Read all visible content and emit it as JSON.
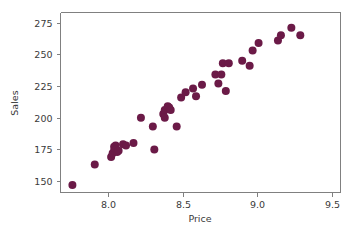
{
  "chart_data": {
    "type": "scatter",
    "title": "",
    "xlabel": "Price",
    "ylabel": "Sales",
    "xlim": [
      7.68,
      9.56
    ],
    "ylim": [
      141,
      283
    ],
    "xticks": [
      "8.0",
      "8.5",
      "9.0",
      "9.5"
    ],
    "xtick_values": [
      8.0,
      8.5,
      9.0,
      9.5
    ],
    "yticks": [
      "150",
      "175",
      "200",
      "225",
      "250",
      "275"
    ],
    "ytick_values": [
      150,
      175,
      200,
      225,
      250,
      275
    ],
    "grid": false,
    "legend": null,
    "marker_color": "#6b1a47",
    "marker_size": 4.0,
    "frame_color": "#808080",
    "background_color": "#ffffff",
    "x": [
      7.76,
      7.91,
      8.02,
      8.03,
      8.04,
      8.04,
      8.05,
      8.05,
      8.06,
      8.07,
      8.1,
      8.12,
      8.17,
      8.22,
      8.3,
      8.31,
      8.37,
      8.38,
      8.38,
      8.4,
      8.41,
      8.42,
      8.46,
      8.49,
      8.52,
      8.57,
      8.59,
      8.63,
      8.72,
      8.74,
      8.76,
      8.77,
      8.79,
      8.81,
      8.9,
      8.95,
      8.97,
      9.01,
      9.14,
      9.16,
      9.23,
      9.29
    ],
    "y": [
      147,
      163,
      169,
      172,
      174,
      177,
      178,
      175,
      173,
      174,
      179,
      178,
      180,
      200,
      193,
      175,
      203,
      206,
      200,
      209,
      208,
      206,
      193,
      216,
      220,
      223,
      217,
      226,
      234,
      227,
      234,
      243,
      221,
      243,
      245,
      241,
      253,
      259,
      261,
      265,
      271,
      265
    ],
    "points": [
      {
        "x": 7.76,
        "y": 147
      },
      {
        "x": 7.91,
        "y": 163
      },
      {
        "x": 8.02,
        "y": 169
      },
      {
        "x": 8.03,
        "y": 172
      },
      {
        "x": 8.04,
        "y": 174
      },
      {
        "x": 8.04,
        "y": 177
      },
      {
        "x": 8.05,
        "y": 178
      },
      {
        "x": 8.05,
        "y": 175
      },
      {
        "x": 8.06,
        "y": 173
      },
      {
        "x": 8.07,
        "y": 174
      },
      {
        "x": 8.1,
        "y": 179
      },
      {
        "x": 8.12,
        "y": 178
      },
      {
        "x": 8.17,
        "y": 180
      },
      {
        "x": 8.22,
        "y": 200
      },
      {
        "x": 8.3,
        "y": 193
      },
      {
        "x": 8.31,
        "y": 175
      },
      {
        "x": 8.37,
        "y": 203
      },
      {
        "x": 8.38,
        "y": 206
      },
      {
        "x": 8.38,
        "y": 200
      },
      {
        "x": 8.4,
        "y": 209
      },
      {
        "x": 8.41,
        "y": 208
      },
      {
        "x": 8.42,
        "y": 206
      },
      {
        "x": 8.46,
        "y": 193
      },
      {
        "x": 8.49,
        "y": 216
      },
      {
        "x": 8.52,
        "y": 220
      },
      {
        "x": 8.57,
        "y": 223
      },
      {
        "x": 8.59,
        "y": 217
      },
      {
        "x": 8.63,
        "y": 226
      },
      {
        "x": 8.72,
        "y": 234
      },
      {
        "x": 8.74,
        "y": 227
      },
      {
        "x": 8.76,
        "y": 234
      },
      {
        "x": 8.77,
        "y": 243
      },
      {
        "x": 8.79,
        "y": 221
      },
      {
        "x": 8.81,
        "y": 243
      },
      {
        "x": 8.9,
        "y": 245
      },
      {
        "x": 8.95,
        "y": 241
      },
      {
        "x": 8.97,
        "y": 253
      },
      {
        "x": 9.01,
        "y": 259
      },
      {
        "x": 9.14,
        "y": 261
      },
      {
        "x": 9.16,
        "y": 265
      },
      {
        "x": 9.23,
        "y": 271
      },
      {
        "x": 9.29,
        "y": 265
      }
    ]
  }
}
